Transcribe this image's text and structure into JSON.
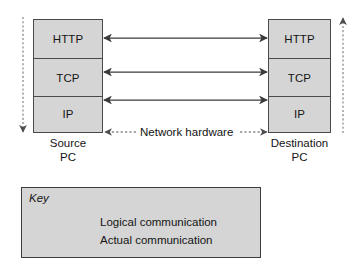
{
  "diagram": {
    "colors": {
      "box_fill": "#d5d5d5",
      "box_border": "#4a4a4a",
      "arrow_solid": "#3a3a3a",
      "arrow_dotted": "#6e6e6e",
      "text": "#141414",
      "background": "#ffffff"
    }
  },
  "source_stack": {
    "name": "Source PC",
    "caption_line1": "Source",
    "caption_line2": "PC",
    "layers": [
      {
        "label": "HTTP"
      },
      {
        "label": "TCP"
      },
      {
        "label": "IP"
      }
    ]
  },
  "destination_stack": {
    "name": "Destination PC",
    "caption_line1": "Destination",
    "caption_line2": "PC",
    "layers": [
      {
        "label": "HTTP"
      },
      {
        "label": "TCP"
      },
      {
        "label": "IP"
      }
    ]
  },
  "network_hardware": {
    "label": "Network hardware"
  },
  "connections": [
    {
      "layer": "HTTP",
      "style": "solid",
      "direction": "bidirectional",
      "meaning": "Logical communication"
    },
    {
      "layer": "TCP",
      "style": "solid",
      "direction": "bidirectional",
      "meaning": "Logical communication"
    },
    {
      "layer": "IP",
      "style": "solid",
      "direction": "bidirectional",
      "meaning": "Logical communication"
    },
    {
      "layer": "Network hardware",
      "style": "dotted",
      "direction": "bidirectional",
      "meaning": "Actual communication"
    }
  ],
  "vertical_paths": [
    {
      "side": "left",
      "style": "dotted",
      "direction": "down",
      "meaning": "Actual communication descending the source stack"
    },
    {
      "side": "right",
      "style": "dotted",
      "direction": "up",
      "meaning": "Actual communication ascending the destination stack"
    }
  ],
  "key": {
    "title": "Key",
    "entries": [
      {
        "style": "solid",
        "label": "Logical communication"
      },
      {
        "style": "dotted",
        "label": "Actual communication"
      }
    ]
  }
}
